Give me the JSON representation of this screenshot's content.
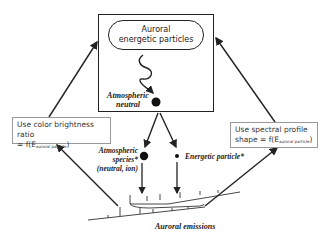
{
  "diagram": {
    "main_box": {
      "pill_line1": "Auroral",
      "pill_line2": "energetic particles",
      "neutral_line1": "Atmospheric",
      "neutral_line2": "neutral"
    },
    "left_note": {
      "line1": "Use color brightness ratio",
      "line2_prefix": "= f(E",
      "line2_sub": "auroral particle",
      "line2_suffix": ")"
    },
    "right_note": {
      "line1": "Use spectral profile",
      "line2_prefix": "shape = f(E",
      "line2_sub": "auroral particle",
      "line2_suffix": ")"
    },
    "species_label": {
      "line1": "Atmospheric",
      "line2": "species*",
      "line3": "(neutral, ion)"
    },
    "energetic_label": "Energetic particle*",
    "emissions_label": "Auroral emissions",
    "colors": {
      "line": "#222222",
      "note_border": "#999999",
      "background": "#ffffff"
    }
  }
}
